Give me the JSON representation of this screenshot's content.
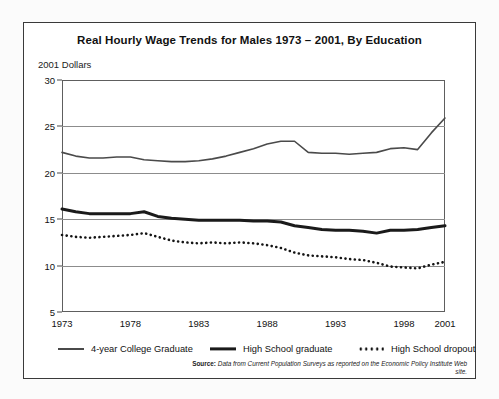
{
  "chart_data": {
    "type": "line",
    "title": "Real Hourly Wage Trends for Males 1973 – 2001, By Education",
    "ylabel": "2001 Dollars",
    "xlabel": "",
    "ylim": [
      5,
      30
    ],
    "yticks": [
      5,
      10,
      15,
      20,
      25,
      30
    ],
    "xlim": [
      1973,
      2001
    ],
    "xticks": [
      1973,
      1978,
      1983,
      1988,
      1993,
      1998,
      2001
    ],
    "xtick_labels": [
      "1973",
      "1978",
      "1983",
      "1988",
      "1993",
      "1998",
      "2001"
    ],
    "ytick_labels": [
      "5",
      "10",
      "15",
      "20",
      "25",
      "30"
    ],
    "grid": true,
    "legend_position": "below-axes",
    "x": [
      1973,
      1974,
      1975,
      1976,
      1977,
      1978,
      1979,
      1980,
      1981,
      1982,
      1983,
      1984,
      1985,
      1986,
      1987,
      1988,
      1989,
      1990,
      1991,
      1992,
      1993,
      1994,
      1995,
      1996,
      1997,
      1998,
      1999,
      2000,
      2001
    ],
    "series": [
      {
        "name": "4-year College Graduate",
        "style": "thin-solid",
        "color": "#4a4a4a",
        "values": [
          22.2,
          21.8,
          21.6,
          21.6,
          21.7,
          21.7,
          21.4,
          21.3,
          21.2,
          21.2,
          21.3,
          21.5,
          21.8,
          22.2,
          22.6,
          23.1,
          23.4,
          23.4,
          22.2,
          22.1,
          22.1,
          22.0,
          22.1,
          22.2,
          22.6,
          22.7,
          22.5,
          24.3,
          25.9
        ]
      },
      {
        "name": "High School graduate",
        "style": "thick-solid",
        "color": "#1a1a1a",
        "values": [
          16.1,
          15.8,
          15.6,
          15.6,
          15.6,
          15.6,
          15.8,
          15.3,
          15.1,
          15.0,
          14.9,
          14.9,
          14.9,
          14.9,
          14.8,
          14.8,
          14.7,
          14.3,
          14.1,
          13.9,
          13.8,
          13.8,
          13.7,
          13.5,
          13.8,
          13.8,
          13.9,
          14.1,
          14.3
        ]
      },
      {
        "name": "High School dropout",
        "style": "dotted",
        "color": "#141414",
        "values": [
          13.3,
          13.1,
          13.0,
          13.1,
          13.2,
          13.3,
          13.5,
          13.1,
          12.7,
          12.5,
          12.4,
          12.5,
          12.4,
          12.5,
          12.4,
          12.2,
          11.9,
          11.4,
          11.1,
          11.0,
          10.9,
          10.7,
          10.6,
          10.3,
          9.9,
          9.8,
          9.7,
          10.1,
          10.4
        ]
      }
    ]
  },
  "legend": {
    "items": [
      {
        "label": "4-year College Graduate",
        "style": "thin-solid"
      },
      {
        "label": "High School graduate",
        "style": "thick-solid"
      },
      {
        "label": "High School dropout",
        "style": "dotted"
      }
    ]
  },
  "source": {
    "prefix": "Source:",
    "text": " Data from Current Population Surveys as reported on the Economic Policy Institute Web site."
  }
}
